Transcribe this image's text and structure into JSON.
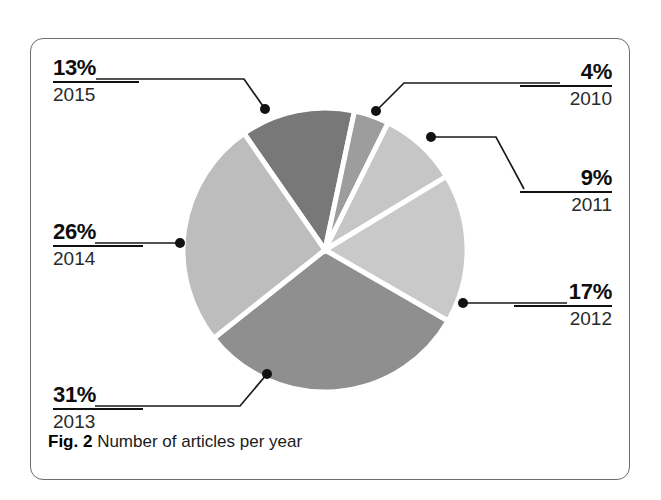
{
  "figure": {
    "caption_label": "Fig. 2",
    "caption_text": "Number of articles per year"
  },
  "chart_data": {
    "type": "pie",
    "title": "Number of articles per year",
    "xlabel": "",
    "ylabel": "",
    "legend_position": "callout-labels",
    "grid": false,
    "unit": "percent",
    "total": 100,
    "categories": [
      "2010",
      "2011",
      "2012",
      "2013",
      "2014",
      "2015"
    ],
    "values": [
      4,
      9,
      17,
      31,
      26,
      13
    ],
    "value_labels": [
      "4%",
      "9%",
      "17%",
      "31%",
      "26%",
      "13%"
    ],
    "colors": [
      "#9d9d9d",
      "#c6c6c6",
      "#c9c9c9",
      "#8f8f8f",
      "#bdbdbd",
      "#787878"
    ],
    "slice_separator_color": "#ffffff",
    "slices": [
      {
        "year": "2010",
        "percent": 4,
        "percent_label": "4%",
        "color": "#9d9d9d"
      },
      {
        "year": "2011",
        "percent": 9,
        "percent_label": "9%",
        "color": "#c6c6c6"
      },
      {
        "year": "2012",
        "percent": 17,
        "percent_label": "17%",
        "color": "#c9c9c9"
      },
      {
        "year": "2013",
        "percent": 31,
        "percent_label": "31%",
        "color": "#8f8f8f"
      },
      {
        "year": "2014",
        "percent": 26,
        "percent_label": "26%",
        "color": "#bdbdbd"
      },
      {
        "year": "2015",
        "percent": 13,
        "percent_label": "13%",
        "color": "#787878"
      }
    ]
  },
  "callouts": {
    "y2015": {
      "percent": "13%",
      "year": "2015"
    },
    "y2010": {
      "percent": "4%",
      "year": "2010"
    },
    "y2011": {
      "percent": "9%",
      "year": "2011"
    },
    "y2012": {
      "percent": "17%",
      "year": "2012"
    },
    "y2013": {
      "percent": "31%",
      "year": "2013"
    },
    "y2014": {
      "percent": "26%",
      "year": "2014"
    }
  }
}
